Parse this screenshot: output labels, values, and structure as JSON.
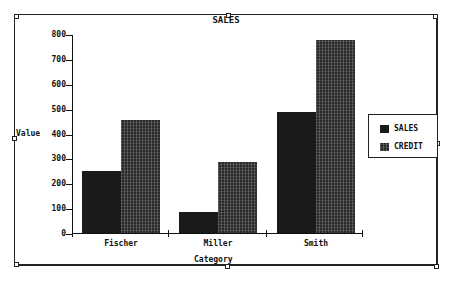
{
  "chart_data": {
    "type": "bar",
    "title": "SALES",
    "xlabel": "Category",
    "ylabel": "Value",
    "categories": [
      "Fischer",
      "Miller",
      "Smith"
    ],
    "series": [
      {
        "name": "SALES",
        "values": [
          255,
          90,
          490
        ],
        "color": "#1a1a1a"
      },
      {
        "name": "CREDIT",
        "values": [
          460,
          290,
          780
        ],
        "color": "#2a2a2a"
      }
    ],
    "yticks": [
      "0",
      "100",
      "200",
      "300",
      "400",
      "500",
      "600",
      "700",
      "800"
    ],
    "ylim": [
      0,
      800
    ],
    "grid": false,
    "legend_position": "right"
  }
}
